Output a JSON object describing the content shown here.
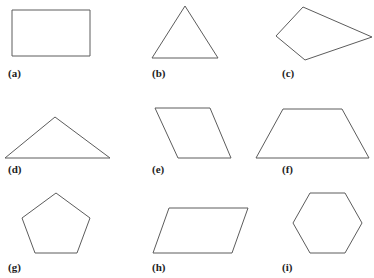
{
  "figure": {
    "background_color": "#ffffff",
    "stroke_color": "#5c5c5c",
    "label_color": "#1d1d1d",
    "width": 374,
    "height": 278,
    "columns": 3,
    "rows": 3,
    "shapes": [
      {
        "label": "(a)",
        "name": "rectangle",
        "sides": 4,
        "cell": {
          "x": 0,
          "y": 0
        },
        "label_pos": {
          "x": 8,
          "y": 68
        },
        "points": "12,10 90,10 90,56 12,56"
      },
      {
        "label": "(b)",
        "name": "triangle",
        "sides": 3,
        "cell": {
          "x": 125,
          "y": 0
        },
        "label_pos": {
          "x": 152,
          "y": 68
        },
        "points": "60,6 93,58 27,58"
      },
      {
        "label": "(c)",
        "name": "kite-quadrilateral",
        "sides": 4,
        "cell": {
          "x": 250,
          "y": 0
        },
        "label_pos": {
          "x": 282,
          "y": 68
        },
        "points": "53,7 122,37 55,60 26,36"
      },
      {
        "label": "(d)",
        "name": "obtuse-triangle",
        "sides": 3,
        "cell": {
          "x": 0,
          "y": 93
        },
        "label_pos": {
          "x": 8,
          "y": 164
        },
        "points": "55,24 110,65 5,65"
      },
      {
        "label": "(e)",
        "name": "parallelogram-steep",
        "sides": 4,
        "cell": {
          "x": 125,
          "y": 93
        },
        "label_pos": {
          "x": 152,
          "y": 164
        },
        "points": "30,15 85,15 106,65 53,65"
      },
      {
        "label": "(f)",
        "name": "trapezoid",
        "sides": 4,
        "cell": {
          "x": 250,
          "y": 93
        },
        "label_pos": {
          "x": 282,
          "y": 164
        },
        "points": "33,16 92,16 119,65 6,65"
      },
      {
        "label": "(g)",
        "name": "pentagon",
        "sides": 5,
        "cell": {
          "x": 0,
          "y": 186
        },
        "label_pos": {
          "x": 8,
          "y": 262
        },
        "points": "56,7 90,32 77,67 35,67 22,32"
      },
      {
        "label": "(h)",
        "name": "parallelogram-wide",
        "sides": 4,
        "cell": {
          "x": 125,
          "y": 186
        },
        "label_pos": {
          "x": 152,
          "y": 262
        },
        "points": "44,22 123,22 107,67 28,67"
      },
      {
        "label": "(i)",
        "name": "hexagon",
        "sides": 6,
        "cell": {
          "x": 250,
          "y": 186
        },
        "label_pos": {
          "x": 282,
          "y": 262
        },
        "points": "60,7 95,7 112,37 95,67 60,67 43,37"
      }
    ]
  }
}
